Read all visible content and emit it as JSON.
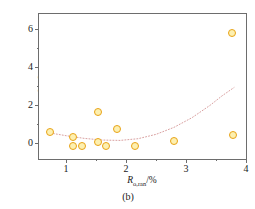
{
  "figure": {
    "caption": "(b)",
    "background_color": "#ffffff"
  },
  "chart_data": {
    "type": "scatter",
    "title": "",
    "xlabel": "Rₒ,ᵣₐₙ/%",
    "xlabel_parts": {
      "symbol": "R",
      "subscript": "o,ran",
      "unit": "/%"
    },
    "ylabel": "孔隙体积/(10⁻³cm³/g)",
    "ylabel_parts": {
      "name": "孔隙体积",
      "unit": "/(10⁻³cm³/g)",
      "unit_base": "/(10",
      "unit_exp": "-3",
      "unit_tail": "cm",
      "unit_tail_exp": "3",
      "unit_end": "/g)"
    },
    "xlim": [
      0.55,
      4.0
    ],
    "ylim": [
      -0.85,
      6.8
    ],
    "xticks": [
      1,
      2,
      3,
      4
    ],
    "xticklabels": [
      "1",
      "2",
      "3",
      "4"
    ],
    "xticks_minor": [
      1.5,
      2.5,
      3.5
    ],
    "yticks": [
      0,
      2,
      4,
      6
    ],
    "yticklabels": [
      "0",
      "2",
      "4",
      "6"
    ],
    "yticks_minor": [
      1,
      3,
      5
    ],
    "grid": false,
    "legend": null,
    "marker": {
      "shape": "circle",
      "face_color": "#fdf0b0",
      "edge_color": "#e8a317",
      "size": 8
    },
    "trendline": {
      "style": "dotted",
      "color": "#d9a0a0",
      "description": "upward-curving quadratic fit"
    },
    "points": [
      {
        "x": 0.74,
        "y": 0.55
      },
      {
        "x": 1.11,
        "y": 0.33
      },
      {
        "x": 1.12,
        "y": -0.16
      },
      {
        "x": 1.27,
        "y": -0.16
      },
      {
        "x": 1.53,
        "y": 1.62
      },
      {
        "x": 1.54,
        "y": 0.03
      },
      {
        "x": 1.67,
        "y": -0.17
      },
      {
        "x": 1.85,
        "y": 0.75
      },
      {
        "x": 2.15,
        "y": -0.17
      },
      {
        "x": 2.8,
        "y": 0.08
      },
      {
        "x": 3.76,
        "y": 5.8
      },
      {
        "x": 3.78,
        "y": 0.39
      }
    ],
    "trend_points": [
      {
        "x": 0.74,
        "y": 0.52
      },
      {
        "x": 1.0,
        "y": 0.38
      },
      {
        "x": 1.3,
        "y": 0.24
      },
      {
        "x": 1.6,
        "y": 0.15
      },
      {
        "x": 1.9,
        "y": 0.13
      },
      {
        "x": 2.2,
        "y": 0.22
      },
      {
        "x": 2.5,
        "y": 0.45
      },
      {
        "x": 2.8,
        "y": 0.82
      },
      {
        "x": 3.1,
        "y": 1.33
      },
      {
        "x": 3.4,
        "y": 1.98
      },
      {
        "x": 3.6,
        "y": 2.48
      },
      {
        "x": 3.8,
        "y": 2.92
      }
    ]
  }
}
